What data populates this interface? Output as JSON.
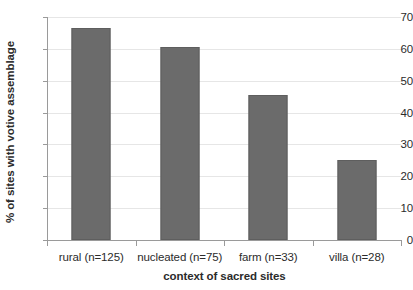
{
  "chart_data": {
    "type": "bar",
    "title": "",
    "categories": [
      "rural (n=125)",
      "nucleated (n=75)",
      "farm (n=33)",
      "villa (n=28)"
    ],
    "values": [
      66.5,
      60.5,
      45.5,
      25.0
    ],
    "xlabel": "context of sacred sites",
    "ylabel": "% of sites with votive assemblage",
    "ylim": [
      0,
      70
    ],
    "ytick_labels": [
      "0",
      "10",
      "20",
      "30",
      "40",
      "50",
      "60",
      "70"
    ],
    "ytick_values": [
      0,
      10,
      20,
      30,
      40,
      50,
      60,
      70
    ],
    "grid": true,
    "legend": false,
    "bar_color": "#6b6b6b",
    "gridline_color": "#e6e6e6",
    "axis_color": "#9a9a9a",
    "background_color": "#ffffff"
  }
}
